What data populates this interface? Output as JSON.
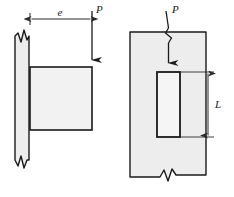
{
  "figure": {
    "title": "",
    "views": [
      {
        "name": "side-view",
        "labels": {
          "eccentricity": "e",
          "load": "P"
        }
      },
      {
        "name": "front-view",
        "labels": {
          "load": "P",
          "length": "L"
        }
      }
    ]
  },
  "colors": {
    "line": "#1a1a1a",
    "fill_light": "#f2f2f2",
    "fill_mid": "#ebebeb",
    "background": "#ffffff",
    "dimension_line": "#3a3a3a"
  },
  "left_view": {
    "wall_strip": {
      "x": 14,
      "y": 28,
      "width": 16,
      "height": 140,
      "fill": "#ededed"
    },
    "beam": {
      "x": 30,
      "y": 67,
      "width": 62,
      "height": 63,
      "fill": "#f2f2f2"
    },
    "dimension_e": {
      "from_x": 30,
      "to_x": 92,
      "y": 19,
      "label": "e"
    },
    "load_arrow": {
      "x": 92,
      "from_y": 12,
      "to_y": 67,
      "label": "P"
    },
    "break_symbols": [
      "wall-top-zigzag",
      "wall-bottom-zigzag"
    ]
  },
  "right_view": {
    "plate": {
      "x": 130,
      "y": 32,
      "width": 76,
      "height": 143,
      "fill": "#ededed"
    },
    "slot": {
      "x": 157,
      "y": 72,
      "width": 23,
      "height": 65,
      "fill": "#f4f4f4"
    },
    "load_arrow": {
      "x": 168,
      "from_y": 12,
      "to_y": 70,
      "label": "P"
    },
    "dimension_L": {
      "x": 208,
      "from_y": 72,
      "to_y": 137,
      "label": "L"
    },
    "break_symbols": [
      "plate-bottom-zigzag",
      "load-arrow-zigzag"
    ]
  }
}
